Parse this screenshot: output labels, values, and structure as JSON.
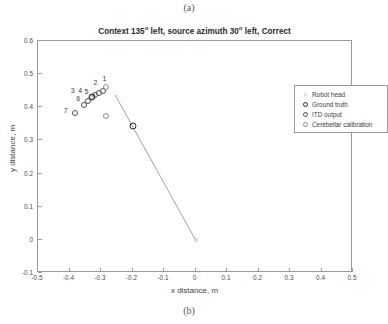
{
  "figure": {
    "caption_a": "(a)",
    "caption_b": "(b)"
  },
  "chart_data": {
    "type": "scatter",
    "title_parts": {
      "seg1": "Context 135",
      "deg1": "o",
      "seg2": " left, source azimuth 30",
      "deg2": "o",
      "seg3": " left, Correct"
    },
    "xlabel": "x distance, m",
    "ylabel": "y distance, m",
    "xlim": [
      -0.5,
      0.5
    ],
    "ylim": [
      -0.1,
      0.6
    ],
    "xticks": [
      -0.5,
      -0.4,
      -0.3,
      -0.2,
      -0.1,
      0,
      0.1,
      0.2,
      0.3,
      0.4,
      0.5
    ],
    "xtick_labels": [
      "-0.5",
      "-0.4",
      "-0.3",
      "-0.2",
      "-0.1",
      "0",
      "0.1",
      "0.2",
      "0.3",
      "0.4",
      "0.5"
    ],
    "yticks": [
      -0.1,
      0,
      0.1,
      0.2,
      0.3,
      0.4,
      0.5,
      0.6
    ],
    "ytick_labels": [
      "-0.1",
      "0",
      "0.1",
      "0.2",
      "0.3",
      "0.4",
      "0.5",
      "0.6"
    ],
    "grid": false,
    "legend_position": "top-right",
    "legend": [
      {
        "label": "Robot head",
        "marker": "dot-faint",
        "class": "lg-head"
      },
      {
        "label": "Ground truth",
        "marker": "circle-bold",
        "class": "lg-truth"
      },
      {
        "label": "ITD output",
        "marker": "circle",
        "class": "lg-itd"
      },
      {
        "label": "Cerebellar calibration",
        "marker": "circle-light",
        "class": "lg-cereb"
      }
    ],
    "head_line": {
      "x": [
        -0.255,
        0.0
      ],
      "y": [
        0.437,
        0.0
      ]
    },
    "series": [
      {
        "name": "Robot head",
        "marker_class": "m-head",
        "points": [
          {
            "x": 0.0,
            "y": 0.0
          }
        ]
      },
      {
        "name": "Ground truth",
        "marker_class": "m-truth",
        "points": [
          {
            "x": -0.33,
            "y": 0.43
          },
          {
            "x": -0.2,
            "y": 0.345
          }
        ]
      },
      {
        "name": "ITD output",
        "marker_class": "m-itd",
        "points": [
          {
            "x": -0.383,
            "y": 0.384,
            "label": "7"
          },
          {
            "x": -0.355,
            "y": 0.407,
            "label": "6"
          },
          {
            "x": -0.34,
            "y": 0.42,
            "label": "5"
          },
          {
            "x": -0.33,
            "y": 0.43,
            "label": "4"
          },
          {
            "x": -0.318,
            "y": 0.437,
            "label": "3"
          },
          {
            "x": -0.305,
            "y": 0.444,
            "label": "2"
          },
          {
            "x": -0.293,
            "y": 0.45,
            "label": "1"
          }
        ]
      },
      {
        "name": "Cerebellar calibration",
        "marker_class": "m-cereb",
        "points": [
          {
            "x": -0.283,
            "y": 0.46
          },
          {
            "x": -0.285,
            "y": 0.375
          }
        ]
      }
    ],
    "point_labels": [
      {
        "text": "1",
        "x": -0.289,
        "y": 0.487
      },
      {
        "text": "2",
        "x": -0.318,
        "y": 0.475
      },
      {
        "text": "3",
        "x": -0.39,
        "y": 0.452
      },
      {
        "text": "4",
        "x": -0.366,
        "y": 0.452
      },
      {
        "text": "5",
        "x": -0.346,
        "y": 0.45
      },
      {
        "text": "6",
        "x": -0.372,
        "y": 0.428
      },
      {
        "text": "7",
        "x": -0.412,
        "y": 0.392
      }
    ]
  }
}
